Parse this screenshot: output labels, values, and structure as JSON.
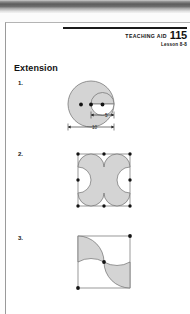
{
  "page": {
    "header": {
      "aid_label": "TEACHING AID",
      "aid_number": "115",
      "lesson": "Lesson 8-8"
    },
    "heading": "Extension",
    "problems": [
      {
        "number": "1.",
        "figure": "circle-with-semicircle-notch",
        "dimensions": [
          {
            "label": "5",
            "name": "inner-dimension"
          },
          {
            "label": "10",
            "name": "outer-dimension"
          }
        ],
        "dot_count": 3
      },
      {
        "number": "2.",
        "figure": "square-with-four-corner-and-four-edge-arcs",
        "dimensions": [],
        "dot_count": 8
      },
      {
        "number": "3.",
        "figure": "square-with-pinwheel-arcs",
        "dimensions": [],
        "dot_count": 3
      }
    ]
  },
  "colors": {
    "fill_gray": "#d4d4d4",
    "stroke": "#6d6d6d",
    "ink": "#111111",
    "paper": "#ffffff"
  }
}
